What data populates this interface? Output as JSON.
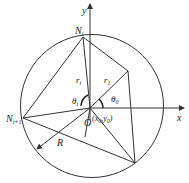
{
  "diagram": {
    "axes": {
      "x_label": "x",
      "y_label": "y"
    },
    "points": {
      "origin": "O",
      "origin_coord": "(x₀,y₀)",
      "origin_coord_parts": {
        "open": "(",
        "x": "x",
        "x_sub": "0",
        "comma": ",",
        "y": "y",
        "y_sub": "0",
        "close": ")"
      },
      "n_i": {
        "base": "N",
        "sub": "i"
      },
      "n_i1": {
        "base": "N",
        "sub": "i+1"
      }
    },
    "labels": {
      "r_i_left": {
        "base": "r",
        "sub": "i"
      },
      "r_i_right": {
        "base": "r",
        "sub": "1"
      },
      "theta_i": {
        "base": "θ",
        "sub": "i"
      },
      "theta_0": {
        "base": "θ",
        "sub": "0"
      },
      "radius": "R"
    },
    "colors": {
      "stroke": "#333333",
      "background": "#ffffff"
    }
  }
}
